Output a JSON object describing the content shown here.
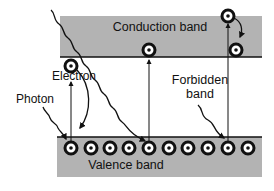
{
  "labels": {
    "conduction_band": "Conduction band",
    "valence_band": "Valence band",
    "forbidden_band_line1": "Forbidden",
    "forbidden_band_line2": "band",
    "electron": "Electron",
    "photon": "Photon"
  },
  "colors": {
    "band_fill": "#b3b3b3",
    "line": "#111111",
    "background": "#ffffff"
  },
  "valence_electrons_count": 10
}
